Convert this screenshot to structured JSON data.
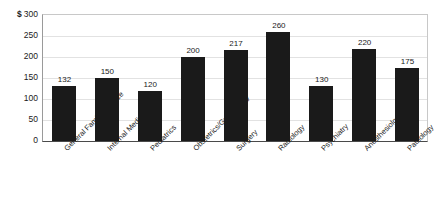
{
  "chart_data": {
    "type": "bar",
    "title": "",
    "xlabel": "",
    "ylabel": "$",
    "currency_symbol": "$",
    "ylim": [
      0,
      300
    ],
    "ytick_values": [
      300,
      250,
      200,
      150,
      100,
      50,
      0
    ],
    "ytick_labels": [
      "300",
      "250",
      "200",
      "150",
      "100",
      "50",
      "0"
    ],
    "grid": true,
    "legend": "none",
    "categories": [
      "General Family Practice",
      "Internal Medicine",
      "Pediatrics",
      "Obstetrics/Gynecology",
      "Surgery",
      "Radiology",
      "Psychiatry",
      "Anesthesiology",
      "Pathology"
    ],
    "values": [
      132,
      150,
      120,
      200,
      217,
      260,
      130,
      220,
      175
    ],
    "data_labels": [
      "132",
      "150",
      "120",
      "200",
      "217",
      "260",
      "130",
      "220",
      "175"
    ],
    "bar_color": "#1a1a1a",
    "plot_background": "#ffffff",
    "gridline_color": "#e2e2e2",
    "axis_color": "#4a4a4a"
  }
}
